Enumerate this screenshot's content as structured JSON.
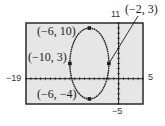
{
  "chart_data": {
    "type": "line",
    "title": "",
    "xlabel": "",
    "ylabel": "",
    "xlim": [
      -19,
      5
    ],
    "ylim": [
      -5,
      11
    ],
    "window_labels": {
      "xmin": "−19",
      "xmax": "5",
      "ymin": "−5",
      "ymax": "11"
    },
    "x_tick_step": 1,
    "y_tick_step": 1,
    "grid": false,
    "legend": null,
    "series": [
      {
        "name": "ellipse",
        "shape": "ellipse",
        "center": [
          -6,
          3
        ],
        "semi_axis_x": 4,
        "semi_axis_y": 7
      }
    ],
    "points": [
      {
        "x": -6,
        "y": 10,
        "label": "(−6, 10)"
      },
      {
        "x": -10,
        "y": 3,
        "label": "(−10, 3)"
      },
      {
        "x": -2,
        "y": 3,
        "label": "(−2, 3)"
      },
      {
        "x": -6,
        "y": -4,
        "label": "(−6, −4)"
      }
    ],
    "annotations": [
      {
        "text": "(−2, 3)",
        "leader_line": true,
        "target": [
          -2,
          3
        ]
      }
    ]
  },
  "colors": {
    "screen_bg": "#e6e6e6",
    "border": "#2a2a2a",
    "curve": "#1a1a1a",
    "page_bg": "#ffffff"
  }
}
